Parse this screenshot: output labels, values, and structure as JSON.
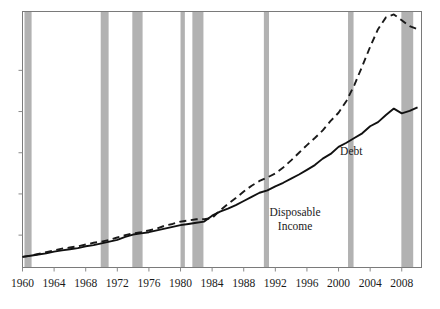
{
  "chart_data": {
    "type": "line",
    "title": "",
    "subtitle": "",
    "xlabel": "",
    "ylabel": "",
    "grid": false,
    "legend_position": "inline-annotation",
    "xlim": [
      1960,
      2010.5
    ],
    "ylim": [
      0,
      4.35
    ],
    "x_ticks": [
      1960,
      1964,
      1968,
      1972,
      1976,
      1980,
      1984,
      1988,
      1992,
      1996,
      2000,
      2004,
      2008
    ],
    "x_tick_labels": [
      "1960",
      "1964",
      "1968",
      "1972",
      "1976",
      "1980",
      "1984",
      "1988",
      "1992",
      "1996",
      "2000",
      "2004",
      "2008"
    ],
    "y_ticks": [],
    "y_tick_labels": [],
    "series": [
      {
        "name": "Debt",
        "style": "dashed",
        "color": "#1a1a1a",
        "label_text": "Debt",
        "label_x": 2000.2,
        "label_y": 1.92,
        "x": [
          1960,
          1961,
          1962,
          1963,
          1964,
          1965,
          1966,
          1967,
          1968,
          1969,
          1970,
          1971,
          1972,
          1973,
          1974,
          1975,
          1976,
          1977,
          1978,
          1979,
          1980,
          1981,
          1982,
          1983,
          1984,
          1985,
          1986,
          1987,
          1988,
          1989,
          1990,
          1991,
          1992,
          1993,
          1994,
          1995,
          1996,
          1997,
          1998,
          1999,
          2000,
          2001,
          2002,
          2003,
          2004,
          2005,
          2006,
          2007,
          2008,
          2009,
          2010
        ],
        "values": [
          0.18,
          0.2,
          0.23,
          0.26,
          0.29,
          0.32,
          0.34,
          0.36,
          0.39,
          0.42,
          0.44,
          0.47,
          0.51,
          0.55,
          0.58,
          0.6,
          0.63,
          0.66,
          0.71,
          0.74,
          0.78,
          0.8,
          0.82,
          0.82,
          0.84,
          0.97,
          1.08,
          1.18,
          1.29,
          1.39,
          1.47,
          1.53,
          1.6,
          1.7,
          1.82,
          1.95,
          2.08,
          2.2,
          2.33,
          2.49,
          2.63,
          2.83,
          3.1,
          3.42,
          3.75,
          4.05,
          4.25,
          4.3,
          4.2,
          4.1,
          4.05
        ]
      },
      {
        "name": "Disposable Income",
        "style": "solid",
        "color": "#111111",
        "label_text": "Disposable\nIncome",
        "label_line1": "Disposable",
        "label_line2": "Income",
        "label_x": 1994.5,
        "label_y": 0.88,
        "x": [
          1960,
          1961,
          1962,
          1963,
          1964,
          1965,
          1966,
          1967,
          1968,
          1969,
          1970,
          1971,
          1972,
          1973,
          1974,
          1975,
          1976,
          1977,
          1978,
          1979,
          1980,
          1981,
          1982,
          1983,
          1984,
          1985,
          1986,
          1987,
          1988,
          1989,
          1990,
          1991,
          1992,
          1993,
          1994,
          1995,
          1996,
          1997,
          1998,
          1999,
          2000,
          2001,
          2002,
          2003,
          2004,
          2005,
          2006,
          2007,
          2008,
          2009,
          2010
        ],
        "values": [
          0.18,
          0.2,
          0.22,
          0.24,
          0.27,
          0.29,
          0.31,
          0.33,
          0.36,
          0.38,
          0.41,
          0.44,
          0.47,
          0.52,
          0.56,
          0.58,
          0.6,
          0.63,
          0.66,
          0.69,
          0.72,
          0.74,
          0.76,
          0.78,
          0.88,
          0.95,
          1.0,
          1.06,
          1.13,
          1.2,
          1.27,
          1.31,
          1.38,
          1.44,
          1.51,
          1.58,
          1.66,
          1.74,
          1.85,
          1.93,
          2.05,
          2.12,
          2.2,
          2.28,
          2.4,
          2.47,
          2.59,
          2.7,
          2.62,
          2.66,
          2.72
        ]
      }
    ],
    "shaded_regions": {
      "name": "recessions",
      "color": "#b2b2b2",
      "opacity": 1,
      "bands": [
        {
          "start": 1960.25,
          "end": 1961.15
        },
        {
          "start": 1969.9,
          "end": 1970.9
        },
        {
          "start": 1973.9,
          "end": 1975.2
        },
        {
          "start": 1980.0,
          "end": 1980.55
        },
        {
          "start": 1981.5,
          "end": 1982.9
        },
        {
          "start": 1990.55,
          "end": 1991.2
        },
        {
          "start": 2001.2,
          "end": 2001.9
        },
        {
          "start": 2007.95,
          "end": 2009.45
        }
      ]
    }
  },
  "axes": {
    "frame_color": "#7a7a7a",
    "tick_color": "#8a8a8a"
  }
}
